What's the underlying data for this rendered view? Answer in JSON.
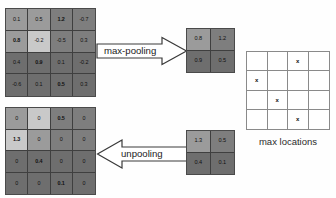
{
  "diagram": {
    "title_absent": true,
    "input_map": {
      "name": "input feature map",
      "rows": [
        [
          {
            "v": "0.1",
            "bold": false,
            "shade": "s-m"
          },
          {
            "v": "0.5",
            "bold": false,
            "shade": "s-m"
          },
          {
            "v": "1.2",
            "bold": true,
            "shade": "s-d"
          },
          {
            "v": "-0.7",
            "bold": false,
            "shade": "s-d"
          }
        ],
        [
          {
            "v": "0.8",
            "bold": true,
            "shade": "s-m"
          },
          {
            "v": "-0.2",
            "bold": false,
            "shade": "s-l"
          },
          {
            "v": "-0.5",
            "bold": false,
            "shade": "s-d"
          },
          {
            "v": "0.3",
            "bold": false,
            "shade": "s-d"
          }
        ],
        [
          {
            "v": "0.4",
            "bold": false,
            "shade": "s-dd"
          },
          {
            "v": "0.9",
            "bold": true,
            "shade": "s-dd"
          },
          {
            "v": "0.1",
            "bold": false,
            "shade": "s-dd"
          },
          {
            "v": "-0.2",
            "bold": false,
            "shade": "s-dd"
          }
        ],
        [
          {
            "v": "-0.6",
            "bold": false,
            "shade": "s-dd"
          },
          {
            "v": "0.1",
            "bold": false,
            "shade": "s-dd"
          },
          {
            "v": "0.5",
            "bold": true,
            "shade": "s-dd"
          },
          {
            "v": "0.3",
            "bold": false,
            "shade": "s-dd"
          }
        ]
      ]
    },
    "pooled_map": {
      "name": "max-pooled output",
      "rows": [
        [
          {
            "v": "0.8",
            "bold": false,
            "shade": "s-m"
          },
          {
            "v": "1.2",
            "bold": false,
            "shade": "s-d"
          }
        ],
        [
          {
            "v": "0.9",
            "bold": false,
            "shade": "s-dd"
          },
          {
            "v": "0.5",
            "bold": false,
            "shade": "s-dd"
          }
        ]
      ]
    },
    "unpool_source": {
      "name": "unpooling input",
      "rows": [
        [
          {
            "v": "1.3",
            "bold": false,
            "shade": "s-m"
          },
          {
            "v": "0.5",
            "bold": false,
            "shade": "s-d"
          }
        ],
        [
          {
            "v": "0.4",
            "bold": false,
            "shade": "s-dd"
          },
          {
            "v": "0.1",
            "bold": false,
            "shade": "s-dd"
          }
        ]
      ]
    },
    "unpooled_map": {
      "name": "unpooled feature map",
      "rows": [
        [
          {
            "v": "0",
            "bold": false,
            "shade": "s-m"
          },
          {
            "v": "0",
            "bold": false,
            "shade": "s-l"
          },
          {
            "v": "0.5",
            "bold": true,
            "shade": "s-d"
          },
          {
            "v": "0",
            "bold": false,
            "shade": "s-d"
          }
        ],
        [
          {
            "v": "1.3",
            "bold": true,
            "shade": "s-l"
          },
          {
            "v": "0",
            "bold": false,
            "shade": "s-m"
          },
          {
            "v": "0",
            "bold": false,
            "shade": "s-d"
          },
          {
            "v": "0",
            "bold": false,
            "shade": "s-d"
          }
        ],
        [
          {
            "v": "0",
            "bold": false,
            "shade": "s-dd"
          },
          {
            "v": "0.4",
            "bold": true,
            "shade": "s-dd"
          },
          {
            "v": "0",
            "bold": false,
            "shade": "s-dd"
          },
          {
            "v": "0",
            "bold": false,
            "shade": "s-dd"
          }
        ],
        [
          {
            "v": "0",
            "bold": false,
            "shade": "s-dd"
          },
          {
            "v": "0",
            "bold": false,
            "shade": "s-dd"
          },
          {
            "v": "0.1",
            "bold": true,
            "shade": "s-dd"
          },
          {
            "v": "0",
            "bold": false,
            "shade": "s-dd"
          }
        ]
      ]
    },
    "max_locations": {
      "caption": "max locations",
      "marker": "x",
      "rows": [
        [
          "",
          "",
          "x",
          ""
        ],
        [
          "x",
          "",
          "",
          ""
        ],
        [
          "",
          "x",
          "",
          ""
        ],
        [
          "",
          "",
          "x",
          ""
        ]
      ]
    },
    "arrows": {
      "max_pooling_label": "max-pooling",
      "unpooling_label": "unpooling"
    }
  }
}
